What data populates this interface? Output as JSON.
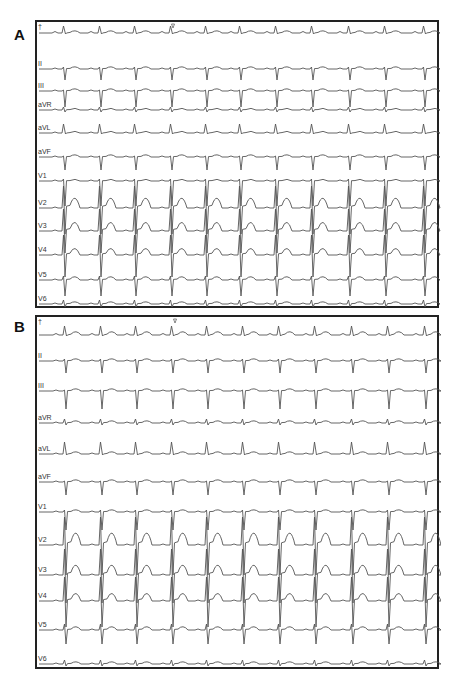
{
  "figure": {
    "panels": [
      {
        "id": "A",
        "label": "A"
      },
      {
        "id": "B",
        "label": "B"
      }
    ]
  },
  "chart_data": [
    {
      "type": "ecg",
      "title": "A",
      "panel_box": {
        "x": 35,
        "y": 20,
        "w": 404,
        "h": 288
      },
      "leads": [
        "I",
        "II",
        "III",
        "aVR",
        "aVL",
        "aVF",
        "V1",
        "V2",
        "V3",
        "V4",
        "V5",
        "V6"
      ],
      "lead_label_text": [
        "",
        "II",
        "III",
        "aVR",
        "aVL",
        "aVF",
        "V1",
        "V2",
        "V3",
        "V4",
        "V5",
        "V6"
      ],
      "lead_baselines_y": [
        31,
        67,
        89,
        108,
        131,
        155,
        179,
        206,
        229,
        253,
        278,
        302
      ],
      "beat_x": [
        62,
        98,
        133,
        169,
        204,
        238,
        274,
        310,
        347,
        383,
        422
      ],
      "heart_rate_note": "regular narrow-complex rhythm, ~11 beats per strip",
      "marker_x": 171,
      "morphology": {
        "I": {
          "r": 7,
          "s": 0,
          "t": 2,
          "p": 1.5
        },
        "II": {
          "r": 2,
          "s": 11,
          "t": 2,
          "p": 1
        },
        "III": {
          "r": 1,
          "s": 16,
          "t": 2,
          "p": 1
        },
        "aVR": {
          "r": 3,
          "s": 2,
          "t": 1.5,
          "p": 1
        },
        "aVL": {
          "r": 9,
          "s": 0,
          "t": 1.5,
          "p": 1
        },
        "aVF": {
          "r": 1,
          "s": 13,
          "t": 2,
          "p": 1
        },
        "V1": {
          "r": 2,
          "s": 25,
          "t": 1.5,
          "p": 1
        },
        "V2": {
          "r": 22,
          "s": 26,
          "t": 9,
          "p": 1
        },
        "V3": {
          "r": 22,
          "s": 22,
          "t": 8,
          "p": 1
        },
        "V4": {
          "r": 20,
          "s": 22,
          "t": 6,
          "p": 1
        },
        "V5": {
          "r": 4,
          "s": 16,
          "t": 3,
          "p": 1
        },
        "V6": {
          "r": 4,
          "s": 3,
          "t": 2,
          "p": 1
        }
      }
    },
    {
      "type": "ecg",
      "title": "B",
      "panel_box": {
        "x": 35,
        "y": 315,
        "w": 404,
        "h": 354
      },
      "leads": [
        "I",
        "II",
        "III",
        "aVR",
        "aVL",
        "aVF",
        "V1",
        "V2",
        "V3",
        "V4",
        "V5",
        "V6"
      ],
      "lead_label_text": [
        "",
        "II",
        "III",
        "aVR",
        "aVL",
        "aVF",
        "V1",
        "V2",
        "V3",
        "V4",
        "V5",
        "V6"
      ],
      "lead_baselines_y": [
        333,
        359,
        389,
        421,
        452,
        480,
        510,
        543,
        573,
        599,
        628,
        662
      ],
      "beat_x": [
        63,
        99,
        134,
        170,
        205,
        241,
        277,
        313,
        350,
        386,
        423
      ],
      "heart_rate_note": "regular narrow-complex rhythm, ~11 beats per strip",
      "marker_x": 173,
      "morphology": {
        "I": {
          "r": 9,
          "s": 0,
          "t": 3,
          "p": 1.5
        },
        "II": {
          "r": 2,
          "s": 12,
          "t": 2,
          "p": 1
        },
        "III": {
          "r": 1,
          "s": 18,
          "t": 2,
          "p": 1
        },
        "aVR": {
          "r": 4,
          "s": 2,
          "t": 2,
          "p": 1
        },
        "aVL": {
          "r": 12,
          "s": 0,
          "t": 2,
          "p": 1
        },
        "aVF": {
          "r": 1,
          "s": 13,
          "t": 2,
          "p": 1
        },
        "V1": {
          "r": 2,
          "s": 18,
          "t": 2,
          "p": 1
        },
        "V2": {
          "r": 28,
          "s": 30,
          "t": 11,
          "p": 1
        },
        "V3": {
          "r": 26,
          "s": 28,
          "t": 9,
          "p": 1
        },
        "V4": {
          "r": 24,
          "s": 26,
          "t": 7,
          "p": 1
        },
        "V5": {
          "r": 6,
          "s": 14,
          "t": 3,
          "p": 1
        },
        "V6": {
          "r": 4,
          "s": 2,
          "t": 2,
          "p": 1
        }
      }
    }
  ]
}
